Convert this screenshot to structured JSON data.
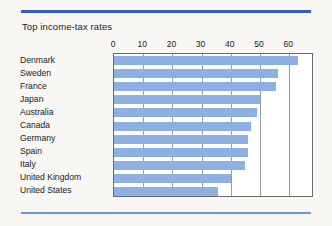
{
  "figure": {
    "title": "Top income-tax rates",
    "accent_color": "#2f5fc4",
    "rule_bottom_color": "#6d96d8",
    "background_color": "#f8f7f4",
    "bar_color": "#8cb0e4",
    "plot_background": "#ffffff",
    "plot_border_color": "#6a6a6a",
    "gridline_color": "#9a9a9a"
  },
  "chart_data": {
    "type": "bar",
    "orientation": "horizontal",
    "title": "Top income-tax rates",
    "xlabel": "",
    "ylabel": "",
    "xlim": [
      0,
      68.5
    ],
    "xticks": [
      0,
      10,
      20,
      30,
      40,
      50,
      60
    ],
    "xtick_labels": [
      "0",
      "10",
      "20",
      "30",
      "40",
      "50",
      "60"
    ],
    "grid": true,
    "grid_axis": "x",
    "legend": false,
    "categories": [
      "Denmark",
      "Sweden",
      "France",
      "Japan",
      "Australia",
      "Canada",
      "Germany",
      "Spain",
      "Italy",
      "United Kingdom",
      "United States"
    ],
    "values": [
      63,
      56,
      55.5,
      50,
      49,
      47,
      46,
      46,
      45,
      40,
      35.5
    ],
    "series": [
      {
        "name": "Top income-tax rate",
        "values": [
          63,
          56,
          55.5,
          50,
          49,
          47,
          46,
          46,
          45,
          40,
          35.5
        ]
      }
    ]
  }
}
